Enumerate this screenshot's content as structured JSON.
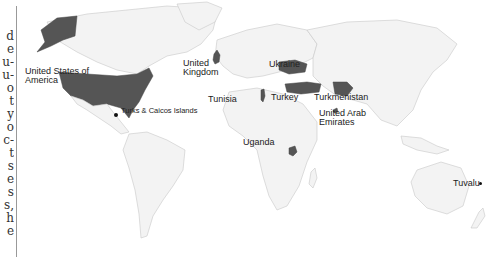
{
  "margin_fragments": [
    "d",
    "e",
    "u-",
    "u-",
    "o",
    "t",
    "y",
    "o",
    "c-",
    "t",
    "s",
    "e",
    "s",
    "s,",
    "h",
    "e"
  ],
  "map": {
    "highlight_color": "#555555",
    "land_color": "#f3f3f3",
    "border_color": "#c8c8c8",
    "labels": {
      "usa": "United States of America",
      "usa_line1": "United States of",
      "usa_line2": "America",
      "turks": "Turks & Caicos Islands",
      "uk_line1": "United",
      "uk_line2": "Kingdom",
      "tunisia": "Tunisia",
      "ukraine": "Ukraine",
      "turkey": "Turkey",
      "turkmenistan": "Turkmenistan",
      "uae_line1": "United Arab",
      "uae_line2": "Emirates",
      "uganda": "Uganda",
      "tuvalu": "Tuvalu"
    },
    "highlighted_countries": [
      "United States of America",
      "United Kingdom",
      "Tunisia",
      "Ukraine",
      "Turkey",
      "Turkmenistan",
      "United Arab Emirates",
      "Uganda"
    ],
    "point_markers": [
      "Turks & Caicos Islands",
      "Tuvalu"
    ]
  }
}
